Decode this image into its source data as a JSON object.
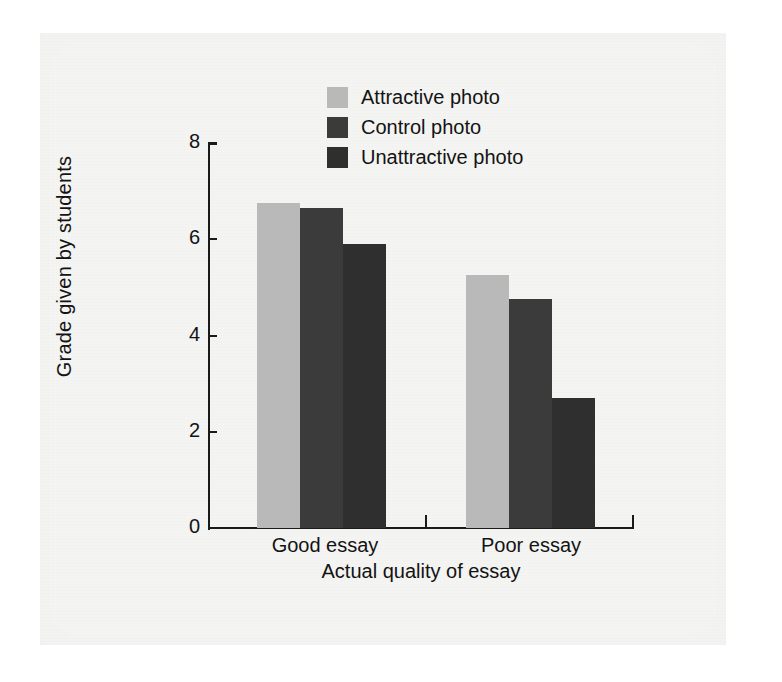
{
  "chart_data": {
    "type": "bar",
    "title": "",
    "xlabel": "Actual quality of essay",
    "ylabel": "Grade given by students",
    "categories": [
      "Good essay",
      "Poor essay"
    ],
    "series": [
      {
        "name": "Attractive photo",
        "color": "#b9b9b9",
        "values": [
          6.75,
          5.25
        ]
      },
      {
        "name": "Control photo",
        "color": "#3b3b3b",
        "values": [
          6.65,
          4.75
        ]
      },
      {
        "name": "Unattractive photo",
        "color": "#2f2f2f",
        "values": [
          5.9,
          2.7
        ]
      }
    ],
    "ylim": [
      0,
      8
    ],
    "yticks": [
      0,
      2,
      4,
      6,
      8
    ],
    "ytick_labels": [
      "0",
      "2",
      "4",
      "6",
      "8"
    ],
    "grid": false,
    "legend_position": "top-center",
    "axis_color": "#1a1a1a"
  },
  "legend": {
    "items": [
      {
        "label": "Attractive photo",
        "color": "#b9b9b9"
      },
      {
        "label": "Control photo",
        "color": "#3b3b3b"
      },
      {
        "label": "Unattractive photo",
        "color": "#2f2f2f"
      }
    ]
  },
  "axes": {
    "y_title": "Grade given by students",
    "x_title": "Actual quality of essay",
    "y_tick_labels": [
      "8",
      "6",
      "4",
      "2",
      "0"
    ],
    "x_group_labels": [
      "Good essay",
      "Poor essay"
    ]
  }
}
